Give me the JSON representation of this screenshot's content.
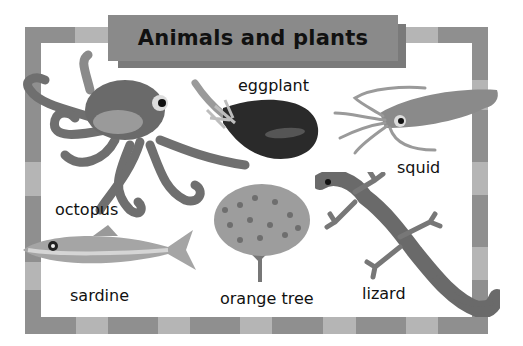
{
  "title": "Animals and plants",
  "items": [
    {
      "name": "octopus",
      "label": "octopus",
      "icon": "octopus-illustration"
    },
    {
      "name": "eggplant",
      "label": "eggplant",
      "icon": "eggplant-illustration"
    },
    {
      "name": "squid",
      "label": "squid",
      "icon": "squid-illustration"
    },
    {
      "name": "sardine",
      "label": "sardine",
      "icon": "sardine-illustration"
    },
    {
      "name": "orange-tree",
      "label": "orange tree",
      "icon": "orange-tree-illustration"
    },
    {
      "name": "lizard",
      "label": "lizard",
      "icon": "lizard-illustration"
    }
  ],
  "colors": {
    "border_dark": "#8f8f8f",
    "border_light": "#b5b5b5",
    "title_bg": "#8a8a8a",
    "background": "#ffffff"
  }
}
